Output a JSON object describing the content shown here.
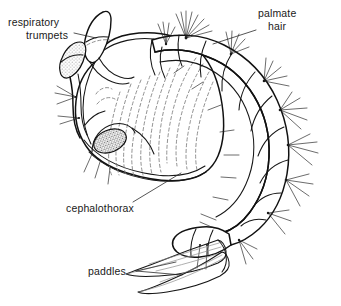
{
  "figure": {
    "title": "",
    "background_color": "#ffffff",
    "ink_color": "#111111",
    "dashed_color": "#7d7d7d",
    "width": 341,
    "height": 306
  },
  "labels": [
    {
      "id": "respiratory-trumpets",
      "lines": [
        "respiratory",
        "trumpets"
      ],
      "line1": "respiratory",
      "line2": "trumpets",
      "anchor": "start",
      "x": 8,
      "y": 26,
      "leader_from": [
        78,
        33
      ],
      "leader_to": [
        93,
        38
      ]
    },
    {
      "id": "palmate-hair",
      "lines": [
        "palmate",
        "hair"
      ],
      "line1": "palmate",
      "line2": "hair",
      "anchor": "start",
      "x": 258,
      "y": 17,
      "leader_from": [
        256,
        30
      ],
      "leader_to": [
        214,
        44
      ]
    },
    {
      "id": "cephalothorax",
      "lines": [
        "cephalothorax"
      ],
      "line1": "cephalothorax",
      "line2": "",
      "anchor": "start",
      "x": 66,
      "y": 212,
      "leader_from": [
        133,
        203
      ],
      "leader_to": [
        180,
        175
      ]
    },
    {
      "id": "paddles",
      "lines": [
        "paddles"
      ],
      "line1": "paddles",
      "line2": "",
      "anchor": "start",
      "x": 88,
      "y": 275,
      "leader_from": [
        135,
        271
      ],
      "leader_to": [
        175,
        262
      ]
    }
  ],
  "parts": [
    {
      "id": "cephalothorax",
      "name": "cephalothorax",
      "description": "large rounded head-and-thorax capsule at left"
    },
    {
      "id": "respiratory-trumpets",
      "name": "respiratory trumpets",
      "description": "pair of funnel-shaped breathing siphons on top of the cephalothorax"
    },
    {
      "id": "compound-eye",
      "name": "compound eye",
      "description": "stippled oval at lower-left of the cephalothorax"
    },
    {
      "id": "abdomen",
      "name": "abdomen",
      "description": "curved segmented tail arcing to the right and down"
    },
    {
      "id": "palmate-hair",
      "name": "palmate hair",
      "description": "fan-shaped tufts of setae on the abdominal segments"
    },
    {
      "id": "paddles",
      "name": "paddles",
      "description": "pair of elongated terminal swimming paddles at lower left of the tail tip"
    }
  ],
  "counts": {
    "respiratory_trumpets": 2,
    "paddles": 2,
    "abdominal_segments": 8
  }
}
